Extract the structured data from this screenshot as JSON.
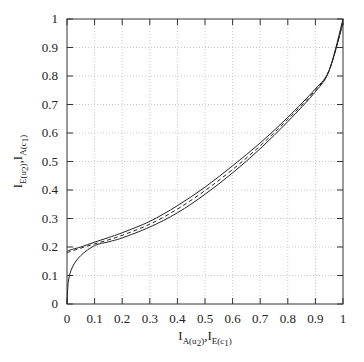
{
  "chart_data": {
    "type": "line",
    "title": "",
    "xlabel": "I_{A(u2)}, I_{E(c1)}",
    "ylabel": "I_{E(u2)}, I_{A(c1)}",
    "xlabel_parts": {
      "main1": "I",
      "sub1": "A(u",
      "subsub1": "2",
      "sub1b": ")",
      "sep": ",",
      "main2": "I",
      "sub2": "E(c",
      "subsub2": "1",
      "sub2b": ")"
    },
    "ylabel_parts": {
      "main1": "I",
      "sub1": "E(u",
      "subsub1": "2",
      "sub1b": ")",
      "sep": ",",
      "main2": "I",
      "sub2": "A(c",
      "subsub2": "1",
      "sub2b": ")"
    },
    "xlim": [
      0,
      1
    ],
    "ylim": [
      0,
      1
    ],
    "grid": true,
    "legend": null,
    "xticks": [
      "0",
      "0.1",
      "0.2",
      "0.3",
      "0.4",
      "0.5",
      "0.6",
      "0.7",
      "0.8",
      "0.9",
      "1"
    ],
    "yticks": [
      "0",
      "0.1",
      "0.2",
      "0.3",
      "0.4",
      "0.5",
      "0.6",
      "0.7",
      "0.8",
      "0.9",
      "1"
    ],
    "x": [
      0,
      0.005,
      0.02,
      0.05,
      0.1,
      0.15,
      0.2,
      0.3,
      0.4,
      0.5,
      0.6,
      0.7,
      0.8,
      0.9,
      0.95,
      1
    ],
    "series": [
      {
        "name": "upper-solid",
        "style": "solid",
        "values": [
          0.185,
          0.187,
          0.192,
          0.2,
          0.217,
          0.233,
          0.25,
          0.29,
          0.345,
          0.41,
          0.485,
          0.565,
          0.655,
          0.755,
          0.82,
          0.985
        ]
      },
      {
        "name": "lower-solid",
        "style": "solid",
        "values": [
          0.0,
          0.08,
          0.13,
          0.17,
          0.205,
          0.218,
          0.232,
          0.27,
          0.32,
          0.385,
          0.46,
          0.545,
          0.64,
          0.745,
          0.82,
          1.0
        ]
      },
      {
        "name": "dashed",
        "style": "dashed",
        "values": [
          0.18,
          0.182,
          0.187,
          0.196,
          0.211,
          0.225,
          0.241,
          0.28,
          0.333,
          0.398,
          0.472,
          0.555,
          0.648,
          0.75,
          0.82,
          0.99
        ]
      }
    ]
  }
}
